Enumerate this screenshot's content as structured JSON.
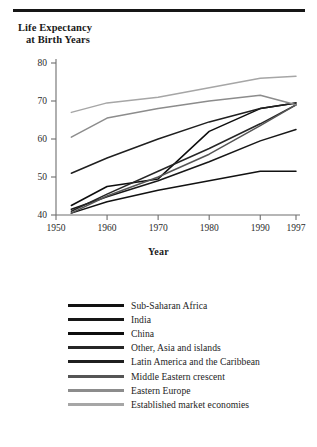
{
  "figure": {
    "y_caption_line1": "Life Expectancy",
    "y_caption_line2": "at Birth Years",
    "x_axis_title": "Year"
  },
  "chart_data": {
    "type": "line",
    "title": "Life Expectancy at Birth Years",
    "xlabel": "Year",
    "ylabel": "Life Expectancy at Birth Years",
    "xlim": [
      1950,
      1997
    ],
    "ylim": [
      40,
      80
    ],
    "xticks": [
      1950,
      1960,
      1970,
      1980,
      1990,
      1997
    ],
    "yticks": [
      40,
      50,
      60,
      70,
      80
    ],
    "grid": false,
    "legend_position": "below",
    "x": [
      1953,
      1960,
      1970,
      1980,
      1990,
      1997
    ],
    "series": [
      {
        "name": "Sub-Saharan Africa",
        "color": "#111111",
        "values": [
          40.5,
          43.5,
          46.5,
          49.0,
          51.5,
          51.5
        ]
      },
      {
        "name": "India",
        "color": "#171717",
        "values": [
          41.5,
          44.8,
          49.0,
          54.0,
          59.5,
          62.5
        ]
      },
      {
        "name": "China",
        "color": "#0d0d0d",
        "values": [
          42.5,
          47.5,
          49.5,
          62.0,
          68.0,
          69.5
        ]
      },
      {
        "name": "Other, Asia and islands",
        "color": "#262626",
        "values": [
          41.0,
          45.5,
          51.5,
          57.5,
          64.0,
          69.0
        ]
      },
      {
        "name": "Latin America and the Caribbean",
        "color": "#1f1f1f",
        "values": [
          51.0,
          55.0,
          60.0,
          64.5,
          68.0,
          69.5
        ]
      },
      {
        "name": "Middle Eastern crescent",
        "color": "#555555",
        "values": [
          40.5,
          45.0,
          50.0,
          56.0,
          63.5,
          69.0
        ]
      },
      {
        "name": "Eastern Europe",
        "color": "#8c8c8c",
        "values": [
          60.5,
          65.5,
          68.0,
          70.0,
          71.5,
          69.0
        ]
      },
      {
        "name": "Established market economies",
        "color": "#a6a6a6",
        "values": [
          67.0,
          69.5,
          71.0,
          73.5,
          76.0,
          76.5
        ]
      }
    ]
  },
  "legend": {
    "items": [
      {
        "label": "Sub-Saharan Africa",
        "color": "#111111"
      },
      {
        "label": "India",
        "color": "#171717"
      },
      {
        "label": "China",
        "color": "#0d0d0d"
      },
      {
        "label": "Other, Asia and islands",
        "color": "#262626"
      },
      {
        "label": "Latin America and the Caribbean",
        "color": "#1f1f1f"
      },
      {
        "label": "Middle Eastern crescent",
        "color": "#555555"
      },
      {
        "label": "Eastern Europe",
        "color": "#8c8c8c"
      },
      {
        "label": "Established market economies",
        "color": "#a6a6a6"
      }
    ]
  }
}
